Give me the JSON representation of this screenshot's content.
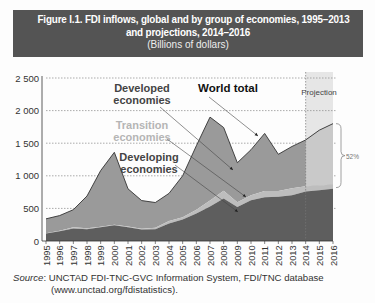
{
  "title": {
    "line1": "Figure I.1. FDI inflows, global and by group of economies, 1995–2013",
    "line2": "and projections, 2014–2016",
    "subtitle": "(Billions of dollars)"
  },
  "source": {
    "label": "Source",
    "text": ": UNCTAD FDI-TNC-GVC Information System, FDI/TNC database",
    "line2": "(www.unctad.org/fdistatistics)."
  },
  "annotations": {
    "developed": [
      "Developed",
      "economies"
    ],
    "world": "World total",
    "transition": [
      "Transition",
      "economies"
    ],
    "developing": [
      "Developing",
      "economies"
    ],
    "projection": "Projection",
    "pct": "52%"
  },
  "colors": {
    "banner": "#545454",
    "developed": "#9a9a9a",
    "transition": "#bdbdbd",
    "developing": "#5e5e5e",
    "projection_band": "#e6e6e6"
  },
  "chart_data": {
    "type": "area",
    "title": "FDI inflows, global and by group of economies, 1995–2013 and projections, 2014–2016",
    "ylabel": "Billions of dollars",
    "xlabel": "",
    "ylim": [
      0,
      2500
    ],
    "yticks": [
      "0",
      "500",
      "1 000",
      "1 500",
      "2 000",
      "2 500"
    ],
    "grid": true,
    "stacked": true,
    "projection_range": [
      2014,
      2016
    ],
    "x": [
      1995,
      1996,
      1997,
      1998,
      1999,
      2000,
      2001,
      2002,
      2003,
      2004,
      2005,
      2006,
      2007,
      2008,
      2009,
      2010,
      2011,
      2012,
      2013,
      2014,
      2015,
      2016
    ],
    "series": [
      {
        "name": "Developing economies",
        "values": [
          115,
          150,
          190,
          180,
          210,
          240,
          210,
          175,
          180,
          270,
          330,
          420,
          530,
          650,
          520,
          625,
          670,
          680,
          700,
          760,
          780,
          800
        ]
      },
      {
        "name": "Transition economies",
        "values": [
          5,
          7,
          20,
          15,
          10,
          10,
          12,
          12,
          25,
          35,
          35,
          60,
          90,
          120,
          75,
          75,
          95,
          85,
          108,
          80,
          70,
          65
        ]
      },
      {
        "name": "Developed economies",
        "values": [
          220,
          233,
          270,
          495,
          860,
          1110,
          578,
          433,
          385,
          425,
          635,
          980,
          1280,
          970,
          605,
          700,
          885,
          565,
          642,
          710,
          850,
          935
        ]
      },
      {
        "name": "World total",
        "values": [
          340,
          390,
          480,
          690,
          1080,
          1360,
          800,
          620,
          590,
          730,
          1000,
          1460,
          1900,
          1740,
          1200,
          1400,
          1650,
          1330,
          1450,
          1550,
          1700,
          1800
        ]
      }
    ],
    "annotations": [
      "World total",
      "Developed economies",
      "Transition economies",
      "Developing economies",
      "Projection",
      "52%"
    ]
  }
}
